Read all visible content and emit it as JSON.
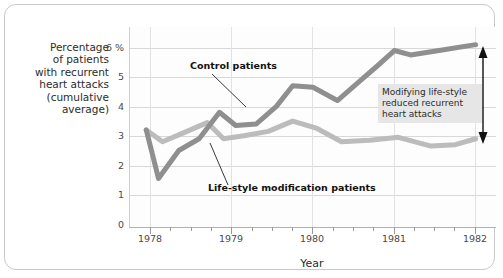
{
  "axis": {
    "y_title": "Percentage\nof patients\nwith recurrent\nheart attacks\n(cumulative\naverage)",
    "x_title": "Year",
    "y_ticks": [
      "6 %",
      "5",
      "4",
      "3",
      "2",
      "1",
      "0"
    ],
    "x_ticks": [
      "1978",
      "1979",
      "1980",
      "1981",
      "1982"
    ]
  },
  "annotations": {
    "control_label": "Control patients",
    "lifestyle_label": "Life-style modification patients",
    "box_text": "Modifying life-style\nreduced recurrent\nheart attacks"
  },
  "colors": {
    "control_line": "#8f8f8f",
    "lifestyle_line": "#bcbcbc",
    "grid": "#d8d8d8",
    "annotation_box_bg": "#e6e6e6",
    "frame_border": "#c9c9c9"
  },
  "chart_data": {
    "type": "line",
    "title": "",
    "xlabel": "Year",
    "ylabel": "Percentage of patients with recurrent heart attacks (cumulative average)",
    "xlim": [
      1977.75,
      1982.25
    ],
    "ylim": [
      0,
      6.8
    ],
    "yticks": [
      0,
      1,
      2,
      3,
      4,
      5,
      6
    ],
    "xticks": [
      1978,
      1979,
      1980,
      1981,
      1982
    ],
    "grid": true,
    "legend": "inline-labels",
    "series": [
      {
        "name": "Control patients",
        "color": "#8f8f8f",
        "x": [
          1977.95,
          1978.1,
          1978.35,
          1978.6,
          1978.85,
          1979.05,
          1979.3,
          1979.55,
          1979.75,
          1980.0,
          1980.3,
          1980.55,
          1980.8,
          1981.0,
          1981.2,
          1981.55,
          1982.0
        ],
        "y": [
          3.3,
          1.65,
          2.6,
          3.0,
          3.9,
          3.45,
          3.5,
          4.1,
          4.8,
          4.75,
          4.3,
          4.9,
          5.5,
          6.0,
          5.85,
          6.0,
          6.2
        ]
      },
      {
        "name": "Life-style modification patients",
        "color": "#bcbcbc",
        "x": [
          1977.95,
          1978.15,
          1978.45,
          1978.7,
          1978.9,
          1979.15,
          1979.45,
          1979.75,
          1980.05,
          1980.35,
          1980.7,
          1981.05,
          1981.45,
          1981.75,
          1982.0
        ],
        "y": [
          3.3,
          2.9,
          3.25,
          3.55,
          3.0,
          3.1,
          3.25,
          3.6,
          3.35,
          2.9,
          2.95,
          3.05,
          2.75,
          2.8,
          3.0
        ]
      }
    ],
    "gap_arrow": {
      "x": 1982.05,
      "y_top": 6.1,
      "y_bottom": 3.0,
      "note": "Modifying life-style reduced recurrent heart attacks"
    }
  }
}
